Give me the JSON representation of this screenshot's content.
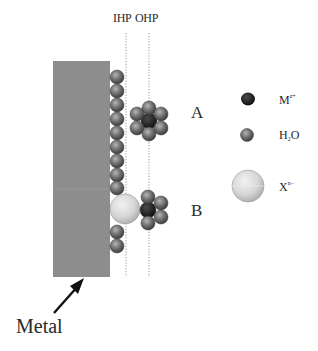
{
  "diagram": {
    "planes": [
      {
        "label": "IHP",
        "x": 126
      },
      {
        "label": "OHP",
        "x": 149
      }
    ],
    "metal": {
      "label": "Metal",
      "color": "#8c8c8c"
    },
    "regions": [
      {
        "label": "A",
        "description": "Hydrated metal cation at OHP (outer-sphere)"
      },
      {
        "label": "B",
        "description": "Specifically adsorbed anion at IHP bridging to cation"
      }
    ],
    "legend": [
      {
        "symbol": "dark-sphere",
        "text": "M",
        "sup": "z+",
        "meaning": "metal cation"
      },
      {
        "symbol": "gray-sphere",
        "text": "H",
        "sub": "2",
        "tail": "O",
        "meaning": "water"
      },
      {
        "symbol": "light-sphere",
        "text": "X",
        "sup": "n−",
        "meaning": "anion"
      }
    ],
    "colors": {
      "metal": "#8c8c8c",
      "water": "#6e6e6e",
      "cation": "#1e1e1e",
      "anion": "#d8d8d8",
      "dotted_line": "#9a9a9a"
    }
  }
}
